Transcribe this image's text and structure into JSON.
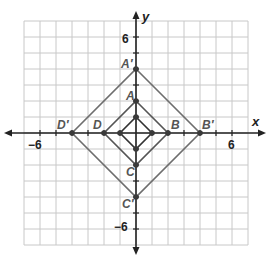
{
  "diagram": {
    "type": "coordinate-plane",
    "axes": {
      "x_label": "x",
      "y_label": "y",
      "x_range": [
        -7,
        7
      ],
      "y_range": [
        -7,
        7
      ],
      "tick_labels": {
        "x_neg": "−6",
        "x_pos": "6",
        "y_pos": "6",
        "y_neg": "−6"
      }
    },
    "colors": {
      "grid": "#c8c8c8",
      "axis": "#222222",
      "inner_square": "#333333",
      "middle_square": "#555555",
      "outer_square": "#6e6e6e",
      "point": "#3a3a3a"
    },
    "shapes": [
      {
        "name": "inner-square",
        "vertices": [
          [
            0,
            1
          ],
          [
            1,
            0
          ],
          [
            0,
            -1
          ],
          [
            -1,
            0
          ]
        ]
      },
      {
        "name": "square-ABCD",
        "vertices": [
          [
            0,
            2
          ],
          [
            2,
            0
          ],
          [
            0,
            -2
          ],
          [
            -2,
            0
          ]
        ]
      },
      {
        "name": "square-A'B'C'D'",
        "vertices": [
          [
            0,
            4
          ],
          [
            4,
            0
          ],
          [
            0,
            -4
          ],
          [
            -4,
            0
          ]
        ]
      }
    ],
    "points": {
      "A": {
        "label": "A",
        "x": 0,
        "y": 2
      },
      "B": {
        "label": "B",
        "x": 2,
        "y": 0
      },
      "C": {
        "label": "C",
        "x": 0,
        "y": -2
      },
      "D": {
        "label": "D",
        "x": -2,
        "y": 0
      },
      "A_prime": {
        "label": "A′",
        "x": 0,
        "y": 4
      },
      "B_prime": {
        "label": "B′",
        "x": 4,
        "y": 0
      },
      "C_prime": {
        "label": "C′",
        "x": 0,
        "y": -4
      },
      "D_prime": {
        "label": "D′",
        "x": -4,
        "y": 0
      }
    }
  }
}
